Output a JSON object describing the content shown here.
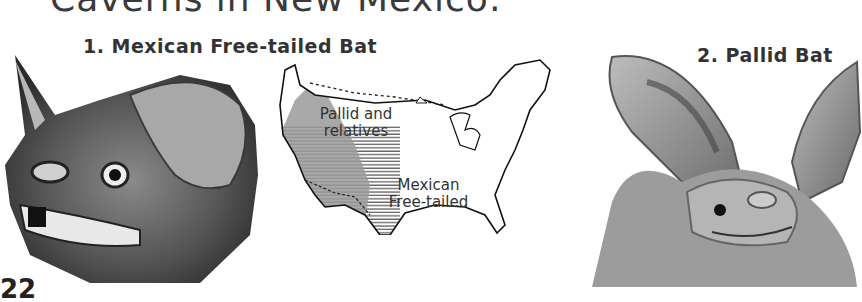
{
  "page": {
    "heading_partial": "Caverns in New Mexico:",
    "page_number_partial": "22"
  },
  "figures": [
    {
      "number": "1.",
      "caption": "1.  Mexican Free-tailed Bat",
      "subject": "mexican-free-tailed-bat-head-illustration"
    },
    {
      "number": "2.",
      "caption": "2.  Pallid Bat",
      "subject": "pallid-bat-head-illustration"
    }
  ],
  "map": {
    "subject": "united-states-range-map",
    "labels": {
      "pallid_line1": "Pallid and",
      "pallid_line2": "relatives",
      "mexican_line1": "Mexican",
      "mexican_line2": "Free-tailed"
    },
    "legend": {
      "pallid_fill": "#9a9a9a",
      "mexican_pattern": "horizontal-hatch"
    }
  }
}
